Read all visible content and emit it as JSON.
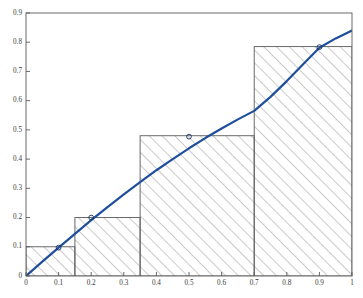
{
  "figure": {
    "title": "",
    "background_color": "#ffffff",
    "axes_color": "#4d4d4d",
    "tick_label_color": "#3a3a3a"
  },
  "chart_data": {
    "type": "area",
    "title": "",
    "xlabel": "",
    "ylabel": "",
    "xlim": [
      0,
      1
    ],
    "ylim": [
      0,
      0.9
    ],
    "grid": false,
    "legend": null,
    "xticks": [
      0,
      0.1,
      0.2,
      0.3,
      0.4,
      0.5,
      0.6,
      0.7,
      0.8,
      0.9,
      1
    ],
    "xtick_labels": [
      "0",
      "0.1",
      "0.2",
      "0.3",
      "0.4",
      "0.5",
      "0.6",
      "0.7",
      "0.8",
      "0.9",
      "1"
    ],
    "yticks": [
      0,
      0.1,
      0.2,
      0.3,
      0.4,
      0.5,
      0.6,
      0.7,
      0.8,
      0.9
    ],
    "ytick_labels": [
      "0",
      "0.1",
      "0.2",
      "0.3",
      "0.4",
      "0.5",
      "0.6",
      "0.7",
      "0.8",
      "0.9"
    ],
    "series": [
      {
        "name": "curve",
        "kind": "line",
        "color": "#1f4f9c",
        "line_width": 2.2,
        "x": [
          0,
          0.05,
          0.1,
          0.15,
          0.2,
          0.25,
          0.3,
          0.35,
          0.4,
          0.45,
          0.5,
          0.55,
          0.6,
          0.65,
          0.7,
          0.75,
          0.8,
          0.85,
          0.9,
          0.95,
          1
        ],
        "y": [
          0,
          0.049,
          0.097,
          0.144,
          0.191,
          0.236,
          0.279,
          0.321,
          0.362,
          0.4,
          0.437,
          0.472,
          0.505,
          0.536,
          0.565,
          0.613,
          0.667,
          0.725,
          0.781,
          0.813,
          0.84
        ]
      },
      {
        "name": "rectangles",
        "kind": "bar-hatched",
        "edge_color": "#595959",
        "hatch": "diagonal-forward",
        "hatch_color": "#808080",
        "intervals": [
          {
            "x_left": 0.0,
            "x_right": 0.15,
            "height": 0.1
          },
          {
            "x_left": 0.15,
            "x_right": 0.35,
            "height": 0.2
          },
          {
            "x_left": 0.35,
            "x_right": 0.7,
            "height": 0.48
          },
          {
            "x_left": 0.7,
            "x_right": 1.0,
            "height": 0.785
          }
        ]
      },
      {
        "name": "sample-points",
        "kind": "scatter",
        "marker": "open-circle",
        "color": "#1f4f9c",
        "points": [
          {
            "x": 0.1,
            "y": 0.097
          },
          {
            "x": 0.2,
            "y": 0.2
          },
          {
            "x": 0.5,
            "y": 0.477
          },
          {
            "x": 0.9,
            "y": 0.783
          }
        ]
      }
    ]
  }
}
